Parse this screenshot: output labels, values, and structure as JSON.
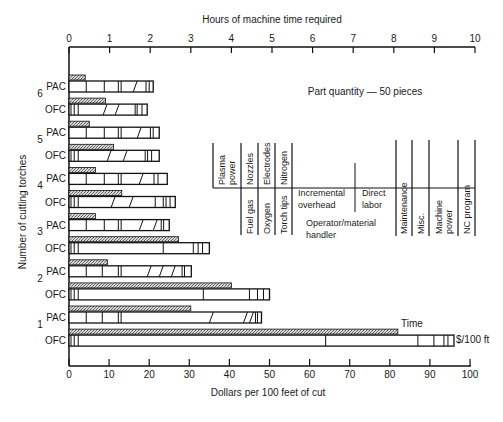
{
  "chart_data": {
    "type": "bar",
    "orientation": "horizontal",
    "title": "",
    "annotation": "Part quantity — 50 pieces",
    "xlabel": "Dollars per 100 feet of cut",
    "x2label": "Hours of machine time required",
    "ylabel": "Number of cutting torches",
    "xlim": [
      0,
      100
    ],
    "x2lim": [
      0,
      10
    ],
    "x_ticks": [
      "0",
      "10",
      "20",
      "30",
      "40",
      "50",
      "60",
      "70",
      "80",
      "90",
      "100"
    ],
    "x2_ticks": [
      "0",
      "1",
      "2",
      "3",
      "4",
      "5",
      "6",
      "7",
      "8",
      "9",
      "10"
    ],
    "grid": false,
    "series_legend": [
      {
        "name": "Time",
        "style": "hatched",
        "axis": "top (hours)"
      },
      {
        "name": "$/100 ft",
        "style": "outlined stacked segments",
        "axis": "bottom (dollars)"
      }
    ],
    "cost_components": [
      "Plasma power",
      "Fuel gas",
      "Nozzles",
      "Oxygen",
      "Electrodes",
      "Torch tips",
      "Nitrogen",
      "Incremental overhead",
      "Operator/material handler",
      "Direct labor",
      "Maintenance",
      "Misc.",
      "Machine power",
      "NC program"
    ],
    "categories": [
      "6 PAC",
      "6 OFC",
      "5 PAC",
      "5 OFC",
      "4 PAC",
      "4 OFC",
      "3 PAC",
      "3 OFC",
      "2 PAC",
      "2 OFC",
      "1 PAC",
      "1 OFC"
    ],
    "series": [
      {
        "name": "Time (hours)",
        "values": [
          0.4,
          0.9,
          0.5,
          1.1,
          0.65,
          1.3,
          0.65,
          2.7,
          0.95,
          4.0,
          3.0,
          8.1
        ]
      },
      {
        "name": "Cost ($/100 ft)",
        "values": [
          21,
          19.5,
          22.5,
          22.5,
          24.5,
          26.5,
          25,
          35,
          30.5,
          50,
          48,
          96
        ]
      }
    ],
    "rows": [
      {
        "torches": "6",
        "process": "PAC",
        "time_h": 0.4,
        "cost": 21,
        "dividers": [
          4.3,
          8.8,
          12.3,
          13.0,
          16.5,
          19.2,
          20.0
        ]
      },
      {
        "torches": "",
        "process": "OFC",
        "time_h": 0.9,
        "cost": 19.5,
        "dividers": [
          0.5,
          1.3,
          2.3,
          9.0,
          12.0,
          16.5,
          17.0,
          18.2
        ]
      },
      {
        "torches": "",
        "process": "PAC",
        "time_h": 0.5,
        "cost": 22.5,
        "dividers": [
          4.3,
          8.8,
          12.3,
          13.0,
          17.5,
          20.3,
          21.0
        ]
      },
      {
        "torches": "5",
        "process": "OFC",
        "time_h": 1.1,
        "cost": 22.5,
        "dividers": [
          0.5,
          1.3,
          2.3,
          10.0,
          14.0,
          19.0,
          19.6,
          20.6
        ]
      },
      {
        "torches": "",
        "process": "PAC",
        "time_h": 0.65,
        "cost": 24.5,
        "dividers": [
          4.3,
          8.8,
          12.3,
          13.0,
          18.0,
          21.2,
          22.2
        ]
      },
      {
        "torches": "4",
        "process": "OFC",
        "time_h": 1.3,
        "cost": 26.5,
        "dividers": [
          0.5,
          1.3,
          2.3,
          11.0,
          15.5,
          21.5,
          23.5,
          24.2,
          25.2
        ]
      },
      {
        "torches": "",
        "process": "PAC",
        "time_h": 0.65,
        "cost": 25,
        "dividers": [
          4.3,
          8.8,
          12.3,
          13.0,
          18.0,
          21.5,
          23.0,
          23.6
        ]
      },
      {
        "torches": "3",
        "process": "OFC",
        "time_h": 2.7,
        "cost": 35,
        "dividers": [
          0.5,
          1.3,
          2.3,
          23.5,
          31.0,
          32.2,
          33.3
        ]
      },
      {
        "torches": "",
        "process": "PAC",
        "time_h": 0.95,
        "cost": 30.5,
        "dividers": [
          4.3,
          8.3,
          12.3,
          13.0,
          20.0,
          23.0,
          26.0,
          28.2,
          28.8
        ]
      },
      {
        "torches": "2",
        "process": "OFC",
        "time_h": 4.0,
        "cost": 50,
        "dividers": [
          0.5,
          1.3,
          2.3,
          33.5,
          45.0,
          47.0,
          48.5
        ]
      },
      {
        "torches": "",
        "process": "PAC",
        "time_h": 3.0,
        "cost": 48,
        "dividers": [
          4.3,
          8.3,
          12.3,
          13.0,
          35.5,
          44.0,
          45.5,
          46.5,
          47.0
        ]
      },
      {
        "torches": "1",
        "process": "OFC",
        "time_h": 8.1,
        "cost": 96,
        "dividers": [
          0.5,
          1.3,
          2.3,
          64.0,
          87.0,
          91.0,
          93.5,
          94.5
        ]
      }
    ],
    "group_labels": [
      {
        "label": "6",
        "y": 97
      },
      {
        "label": "5",
        "y": 143
      },
      {
        "label": "4",
        "y": 189
      },
      {
        "label": "3",
        "y": 235
      },
      {
        "label": "2",
        "y": 282
      },
      {
        "label": "1",
        "y": 328
      }
    ],
    "end_labels": {
      "time": "Time",
      "cost": "$/100 ft"
    },
    "legend_upper": [
      {
        "label": [
          "Plasma",
          "power"
        ],
        "x1": 213,
        "x2": 241
      },
      {
        "label": [
          "Nozzles"
        ],
        "x1": 241,
        "x2": 258
      },
      {
        "label": [
          "Electrodes"
        ],
        "x1": 258,
        "x2": 275
      },
      {
        "label": [
          "Nitrogen"
        ],
        "x1": 275,
        "x2": 292
      }
    ],
    "legend_lower": [
      {
        "label": [
          "Fuel gas"
        ],
        "x1": 241,
        "x2": 258
      },
      {
        "label": [
          "Oxygen"
        ],
        "x1": 258,
        "x2": 275
      },
      {
        "label": [
          "Torch tips"
        ],
        "x1": 275,
        "x2": 292
      },
      {
        "label": [
          "Maintenance"
        ],
        "x1": 396,
        "x2": 412
      },
      {
        "label": [
          "Misc."
        ],
        "x1": 412,
        "x2": 429
      },
      {
        "label": [
          "Machine",
          "power"
        ],
        "x1": 429,
        "x2": 458
      },
      {
        "label": [
          "NC program"
        ],
        "x1": 458,
        "x2": 475
      }
    ],
    "legend_horizontal": [
      {
        "label": [
          "Incremental",
          "overhead"
        ],
        "x": 298,
        "y": 196
      },
      {
        "label": [
          "Direct",
          "labor"
        ],
        "x": 362,
        "y": 196
      },
      {
        "label": [
          "Operator/material",
          "handler"
        ],
        "x": 306,
        "y": 226
      }
    ]
  },
  "text": {
    "top_axis_title": "Hours of machine time required",
    "bottom_axis_title": "Dollars per 100 feet of cut",
    "y_axis_title": "Number of cutting torches",
    "annotation": "Part quantity — 50 pieces",
    "time_label": "Time",
    "cost_label": "$/100 ft"
  }
}
